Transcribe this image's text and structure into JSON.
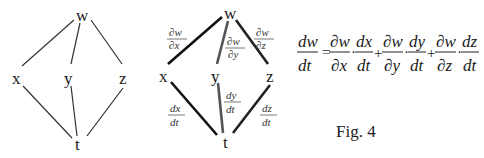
{
  "left_diagram": {
    "nodes": {
      "w": "w",
      "x": "x",
      "y": "y",
      "z": "z",
      "t": "t"
    },
    "edges": [
      [
        "w",
        "x"
      ],
      [
        "w",
        "y"
      ],
      [
        "w",
        "z"
      ],
      [
        "x",
        "t"
      ],
      [
        "y",
        "t"
      ],
      [
        "z",
        "t"
      ]
    ]
  },
  "right_diagram": {
    "nodes": {
      "w": "w",
      "x": "x",
      "y": "y",
      "z": "z",
      "t": "t"
    },
    "edge_labels": {
      "w_x": {
        "num": "∂w",
        "den": "∂x"
      },
      "w_y": {
        "num": "∂w",
        "den": "∂y"
      },
      "w_z": {
        "num": "∂w",
        "den": "∂z"
      },
      "x_t": {
        "num": "dx",
        "den": "dt"
      },
      "y_t": {
        "num": "dy",
        "den": "dt"
      },
      "z_t": {
        "num": "dz",
        "den": "dt"
      }
    }
  },
  "equation": {
    "lhs": {
      "num": "dw",
      "den": "dt"
    },
    "equals": "=",
    "terms": [
      {
        "a": {
          "num": "∂w",
          "den": "∂x"
        },
        "b": {
          "num": "dx",
          "den": "dt"
        }
      },
      {
        "a": {
          "num": "∂w",
          "den": "∂y"
        },
        "b": {
          "num": "dy",
          "den": "dt"
        }
      },
      {
        "a": {
          "num": "∂w",
          "den": "∂z"
        },
        "b": {
          "num": "dz",
          "den": "dt"
        }
      }
    ],
    "plus": "+",
    "dot": "·"
  },
  "caption": "Fig. 4"
}
